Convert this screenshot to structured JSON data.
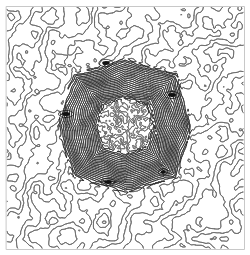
{
  "figure": {
    "width": 250,
    "height": 255,
    "background_color": "#ffffff",
    "line_color": "#555555",
    "dense_line_color": "#2b2b2b",
    "frame_color": "#c8c8c8",
    "frame": {
      "x": 6,
      "y": 6,
      "width": 238,
      "height": 243,
      "stroke_width": 1
    }
  },
  "chart_data": {
    "type": "scatter",
    "xlabel": "",
    "ylabel": "",
    "xlim": [
      0,
      250
    ],
    "ylim": [
      0,
      255
    ],
    "grid": false,
    "legend": "none"
  },
  "regions": [
    {
      "name": "outer-labyrinth",
      "style": "labyrinth",
      "x": 7,
      "y": 7,
      "width": 236,
      "height": 241,
      "line_color": "#6b6b6b",
      "line_width": 0.9,
      "wavelength": 13,
      "description": "Sparse meandering reaction-diffusion maze covering the full frame"
    },
    {
      "name": "mid-stripe-field",
      "style": "stripes",
      "x": 58,
      "y": 58,
      "width": 134,
      "height": 136,
      "line_color": "#2b2b2b",
      "line_width": 0.8,
      "wavelength": 3.4,
      "description": "Dense square band of contour stripes bent around four defects"
    },
    {
      "name": "inner-labyrinth",
      "style": "labyrinth",
      "x": 97,
      "y": 97,
      "width": 56,
      "height": 57,
      "line_color": "#3a3a3a",
      "line_width": 0.7,
      "wavelength": 6,
      "description": "Recursive miniature labyrinth at the centre"
    }
  ],
  "defects": [
    {
      "name": "eye-north",
      "cx": 106,
      "cy": 63,
      "rx": 9,
      "ry": 4.5,
      "angle": 0,
      "core_color": "#111111"
    },
    {
      "name": "eye-east",
      "cx": 172,
      "cy": 95,
      "rx": 4.5,
      "ry": 9.5,
      "angle": 90,
      "core_color": "#111111"
    },
    {
      "name": "eye-south",
      "cx": 108,
      "cy": 182,
      "rx": 9,
      "ry": 4.5,
      "angle": 0,
      "core_color": "#111111"
    },
    {
      "name": "eye-west",
      "cx": 66,
      "cy": 114,
      "rx": 4.5,
      "ry": 9.5,
      "angle": 90,
      "core_color": "#111111"
    },
    {
      "name": "eye-inner-east",
      "cx": 163,
      "cy": 172,
      "rx": 4,
      "ry": 6,
      "angle": 80,
      "core_color": "#111111"
    }
  ],
  "labels": {
    "caption": "",
    "annotations": []
  }
}
